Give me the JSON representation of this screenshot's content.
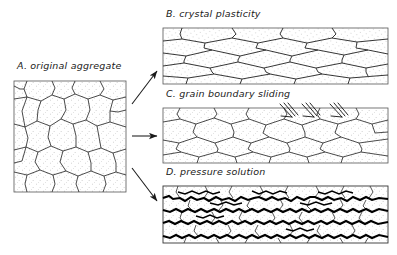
{
  "figure": {
    "title_absent": true,
    "style": {
      "line_color": "#1a1a1a",
      "seam_color": "#000000",
      "stipple_color": "#9a9a9a",
      "grain_fill": "#ffffff",
      "background": "#ffffff"
    },
    "panels": [
      {
        "id": "A",
        "label": "A. original aggregate",
        "letter": "A.",
        "caption": "original aggregate",
        "shape": "square",
        "box": {
          "x": 14,
          "y": 81,
          "w": 112,
          "h": 111
        },
        "description": "equant polygonal grains, stippled fill, no preferred orientation",
        "grain_count": 24,
        "fabric": "isotropic"
      },
      {
        "id": "B",
        "label": "B. crystal plasticity",
        "letter": "B.",
        "caption": "crystal plasticity",
        "shape": "wide-rectangle",
        "box": {
          "x": 163,
          "y": 28,
          "w": 225,
          "h": 56
        },
        "description": "grains flattened and elongated parallel to horizontal, strong shape-preferred orientation",
        "grain_count": 28,
        "fabric": "flattened-foliated"
      },
      {
        "id": "C",
        "label": "C. grain boundary sliding",
        "letter": "C.",
        "caption": "grain boundary sliding",
        "shape": "wide-rectangle",
        "box": {
          "x": 163,
          "y": 108,
          "w": 225,
          "h": 55
        },
        "description": "equant polygonal grains preserved, shear-sense tick marks cross the upper boundary",
        "grain_count": 26,
        "fabric": "equant",
        "markers": {
          "name": "sliding-tick-marks",
          "count": 3,
          "positions_x": [
            285,
            305,
            335
          ]
        }
      },
      {
        "id": "D",
        "label": "D. pressure solution",
        "letter": "D.",
        "caption": "pressure solution",
        "shape": "wide-rectangle",
        "box": {
          "x": 163,
          "y": 186,
          "w": 225,
          "h": 57
        },
        "description": "grains truncated by thick dark jagged stylolitic solution seams along horizontal boundaries",
        "grain_count": 40,
        "fabric": "seamed-stylolitic",
        "seam_rows": 5
      }
    ],
    "arrows": [
      {
        "name": "arrow-a-to-b",
        "from": "A",
        "to": "B",
        "x1": 132,
        "y1": 104,
        "x2": 158,
        "y2": 72,
        "direction": "up-right"
      },
      {
        "name": "arrow-a-to-c",
        "from": "A",
        "to": "C",
        "x1": 132,
        "y1": 136,
        "x2": 158,
        "y2": 136,
        "direction": "right"
      },
      {
        "name": "arrow-a-to-d",
        "from": "A",
        "to": "D",
        "x1": 132,
        "y1": 168,
        "x2": 158,
        "y2": 200,
        "direction": "down-right"
      }
    ]
  }
}
